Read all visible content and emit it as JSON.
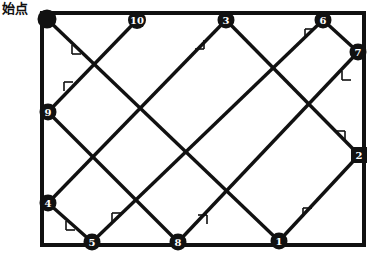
{
  "figure": {
    "kind": "reflection-path-diagram",
    "start_label": "始点",
    "line_color": "#111111",
    "node_fill": "#111111",
    "node_text_color": "#ffffff",
    "background": "#ffffff",
    "border": {
      "x": 42,
      "y": 13,
      "width": 322,
      "height": 232,
      "stroke_width": 4
    },
    "path_stroke_width": 3.4,
    "tick_stroke_width": 1.6,
    "start_point": {
      "x": 47,
      "y": 19,
      "radius": 9.5,
      "label": ""
    },
    "nodes": [
      {
        "label": "1",
        "x": 279,
        "y": 241,
        "r": 8.5,
        "shape": "circle"
      },
      {
        "label": "2",
        "x": 359,
        "y": 155,
        "r": 8.0,
        "shape": "square"
      },
      {
        "label": "3",
        "x": 226,
        "y": 20,
        "r": 8.5,
        "shape": "circle"
      },
      {
        "label": "4",
        "x": 48,
        "y": 203,
        "r": 8.5,
        "shape": "circle"
      },
      {
        "label": "5",
        "x": 92,
        "y": 242,
        "r": 8.5,
        "shape": "circle"
      },
      {
        "label": "6",
        "x": 323,
        "y": 20,
        "r": 8.5,
        "shape": "circle"
      },
      {
        "label": "7",
        "x": 358,
        "y": 52,
        "r": 8.5,
        "shape": "circle"
      },
      {
        "label": "8",
        "x": 178,
        "y": 242,
        "r": 8.5,
        "shape": "circle"
      },
      {
        "label": "9",
        "x": 48,
        "y": 112,
        "r": 8.5,
        "shape": "circle"
      },
      {
        "label": "10",
        "x": 137,
        "y": 20,
        "r": 9.0,
        "shape": "circle"
      }
    ],
    "segments": [
      {
        "from": [
          47,
          19
        ],
        "to": [
          279,
          241
        ],
        "name": "start-to-1"
      },
      {
        "from": [
          279,
          241
        ],
        "to": [
          359,
          155
        ],
        "name": "1-to-2"
      },
      {
        "from": [
          359,
          155
        ],
        "to": [
          226,
          20
        ],
        "name": "2-to-3"
      },
      {
        "from": [
          226,
          20
        ],
        "to": [
          48,
          203
        ],
        "name": "3-to-4"
      },
      {
        "from": [
          48,
          203
        ],
        "to": [
          92,
          242
        ],
        "name": "4-to-5"
      },
      {
        "from": [
          92,
          242
        ],
        "to": [
          323,
          20
        ],
        "name": "5-to-6"
      },
      {
        "from": [
          323,
          20
        ],
        "to": [
          358,
          52
        ],
        "name": "6-to-7"
      },
      {
        "from": [
          358,
          52
        ],
        "to": [
          178,
          242
        ],
        "name": "7-to-8"
      },
      {
        "from": [
          178,
          242
        ],
        "to": [
          48,
          112
        ],
        "name": "8-to-9"
      },
      {
        "from": [
          48,
          112
        ],
        "to": [
          137,
          20
        ],
        "name": "9-to-10"
      }
    ],
    "ticks": [
      {
        "x": 72,
        "y": 45,
        "dir": "dr",
        "name": "tick-start-to-1"
      },
      {
        "x": 303,
        "y": 217,
        "dir": "ur",
        "name": "tick-1-to-2"
      },
      {
        "x": 345,
        "y": 140,
        "dir": "ul",
        "name": "tick-2-to-3"
      },
      {
        "x": 204,
        "y": 40,
        "dir": "dl",
        "name": "tick-3-to-4"
      },
      {
        "x": 66,
        "y": 221,
        "dir": "dr",
        "name": "tick-4-to-5"
      },
      {
        "x": 112,
        "y": 222,
        "dir": "ur",
        "name": "tick-5-to-6"
      },
      {
        "x": 305,
        "y": 38,
        "dir": "ur",
        "name": "tick-6-to-7"
      },
      {
        "x": 342,
        "y": 71,
        "dir": "dr",
        "name": "tick-7-to-8"
      },
      {
        "x": 207,
        "y": 224,
        "dir": "ul",
        "name": "tick-8-to-9"
      },
      {
        "x": 64,
        "y": 91,
        "dir": "ur",
        "name": "tick-9-to-10"
      }
    ]
  }
}
